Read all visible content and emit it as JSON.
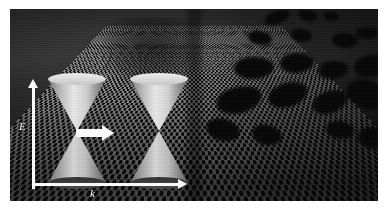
{
  "figure": {
    "caption": "",
    "background_color": "#ffffff"
  },
  "sample": {
    "name": "honeycomb-lattice",
    "description": "hexagonal honeycomb lattice viewed in perspective",
    "lattice_color": "#8d8d8d",
    "hole_color": "#0a0a0a",
    "dark_band_label": "",
    "patches": [
      {
        "left": 58,
        "top": 2,
        "width": 26,
        "height": 13
      },
      {
        "left": 92,
        "top": 1,
        "width": 20,
        "height": 11
      },
      {
        "left": 118,
        "top": 3,
        "width": 15,
        "height": 9
      },
      {
        "left": 42,
        "top": 22,
        "width": 24,
        "height": 14
      },
      {
        "left": 84,
        "top": 20,
        "width": 22,
        "height": 13
      },
      {
        "left": 126,
        "top": 24,
        "width": 26,
        "height": 15
      },
      {
        "left": 150,
        "top": 18,
        "width": 22,
        "height": 12
      },
      {
        "left": 28,
        "top": 48,
        "width": 40,
        "height": 22
      },
      {
        "left": 74,
        "top": 44,
        "width": 34,
        "height": 20
      },
      {
        "left": 112,
        "top": 52,
        "width": 30,
        "height": 18
      },
      {
        "left": 148,
        "top": 46,
        "width": 34,
        "height": 22
      },
      {
        "left": 10,
        "top": 78,
        "width": 46,
        "height": 26
      },
      {
        "left": 62,
        "top": 74,
        "width": 40,
        "height": 24
      },
      {
        "left": 106,
        "top": 82,
        "width": 36,
        "height": 22
      },
      {
        "left": 140,
        "top": 72,
        "width": 44,
        "height": 28
      },
      {
        "left": 0,
        "top": 110,
        "width": 34,
        "height": 22
      },
      {
        "left": 46,
        "top": 116,
        "width": 30,
        "height": 20
      },
      {
        "left": 120,
        "top": 112,
        "width": 28,
        "height": 18
      },
      {
        "left": 152,
        "top": 118,
        "width": 32,
        "height": 22
      }
    ]
  },
  "band_structure": {
    "name": "dirac-cone-diagram",
    "axes": {
      "vertical": {
        "label": "E",
        "meaning": "energy",
        "color": "#ffffff"
      },
      "horizontal": {
        "label": "k",
        "meaning": "momentum",
        "color": "#ffffff"
      }
    },
    "arrow": {
      "label": "",
      "direction": "right",
      "color": "#ffffff"
    },
    "cones": [
      {
        "name": "dirac-cone-left",
        "left": 38,
        "top": 70,
        "width": 58,
        "height": 104
      },
      {
        "name": "dirac-cone-right",
        "left": 120,
        "top": 70,
        "width": 58,
        "height": 104
      }
    ]
  }
}
